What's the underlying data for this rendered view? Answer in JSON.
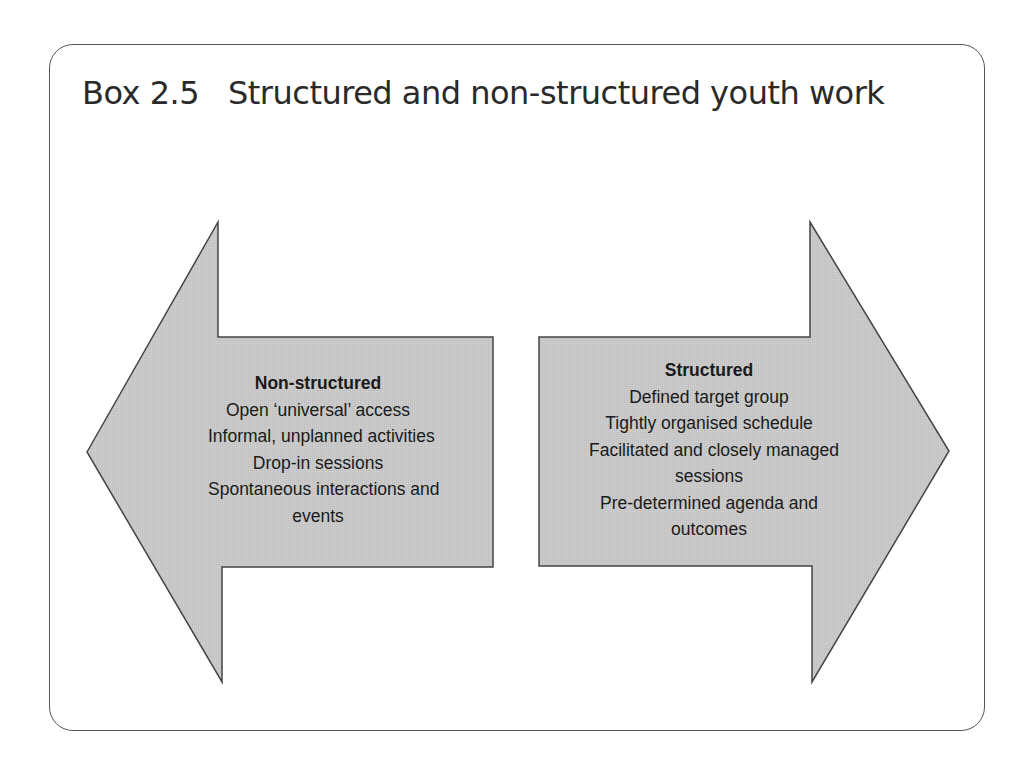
{
  "box": {
    "number": "Box 2.5",
    "title": "Structured and non-structured youth work"
  },
  "colors": {
    "arrow_fill": "#c9c9c9",
    "arrow_stroke": "#444444",
    "frame_stroke": "#555555",
    "text": "#1a1a1a"
  },
  "left_arrow": {
    "direction": "left",
    "heading": "Non-structured",
    "lines": [
      "Open ‘universal’ access",
      "Informal, unplanned activities",
      "Drop-in sessions",
      "Spontaneous interactions and",
      "events"
    ]
  },
  "right_arrow": {
    "direction": "right",
    "heading": "Structured",
    "lines": [
      "Defined target group",
      "Tightly organised schedule",
      "Facilitated and closely managed",
      "sessions",
      "Pre-determined agenda and",
      "outcomes"
    ]
  }
}
